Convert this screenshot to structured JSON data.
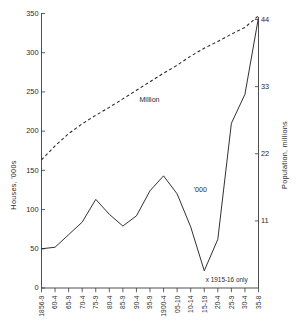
{
  "chart_data": {
    "type": "line",
    "title": "",
    "subtitle": "",
    "xlabel": "",
    "ylabel": "Houses, '000s",
    "y2label": "Population, millions",
    "grid": false,
    "legend_position": "inline-annotation",
    "categories": [
      "1856-9",
      "60-4",
      "65-9",
      "70-4",
      "75-9",
      "80-4",
      "85-9",
      "90-4",
      "95-9",
      "1900-4",
      "05-10",
      "10-14",
      "15-19",
      "20-4",
      "25-9",
      "30-4",
      "35-8"
    ],
    "ylim": [
      0,
      350
    ],
    "yticks": [
      0,
      50,
      100,
      150,
      200,
      250,
      300,
      350
    ],
    "ytick_labels": [
      "0",
      "50",
      "100",
      "150",
      "200",
      "250",
      "300",
      "350"
    ],
    "y2lim": [
      0,
      44
    ],
    "y2ticks": [
      11,
      22,
      33,
      44
    ],
    "y2tick_labels": [
      "11",
      "22",
      "33",
      "44"
    ],
    "series": [
      {
        "name": "'000",
        "style": "solid",
        "axis": "left",
        "label": "'000",
        "label_category_index": 11,
        "label_value": 122,
        "values": [
          50,
          52,
          68,
          84,
          113,
          94,
          79,
          92,
          124,
          143,
          120,
          78,
          22,
          62,
          210,
          247,
          345
        ]
      },
      {
        "name": "Million",
        "style": "dashed",
        "axis": "right",
        "label": "Million",
        "label_category_index": 7,
        "label_value": 30.5,
        "values": [
          21.0,
          23.3,
          25.3,
          26.9,
          28.3,
          29.6,
          31.0,
          32.4,
          33.8,
          35.2,
          36.5,
          38.0,
          39.3,
          40.4,
          41.6,
          42.7,
          44.6
        ]
      }
    ],
    "annotations": [
      {
        "name": "footnote-1915-16",
        "text": "x 1915-16 only",
        "category_index": 12,
        "value": 8
      }
    ],
    "colors": {
      "axis": "#3a3a3a",
      "series": "#262626",
      "background": "#ffffff",
      "text": "#2b2b2b"
    }
  }
}
